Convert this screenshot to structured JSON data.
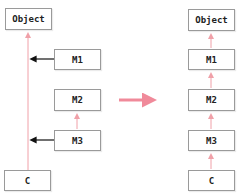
{
  "left_diagram": {
    "title": "",
    "boxes": {
      "object": "Object",
      "m1": "M1",
      "m2": "M2",
      "m3": "M3",
      "c": "C"
    }
  },
  "right_diagram": {
    "boxes": {
      "object": "Object",
      "m1": "M1",
      "m2": "M2",
      "m3": "M3",
      "c": "C"
    }
  },
  "colors": {
    "inherit_line": "#f0a0a8",
    "transform_arrow": "#f08a9a",
    "mixin_arrow": "#111111",
    "box_border": "#9a9a9a"
  }
}
